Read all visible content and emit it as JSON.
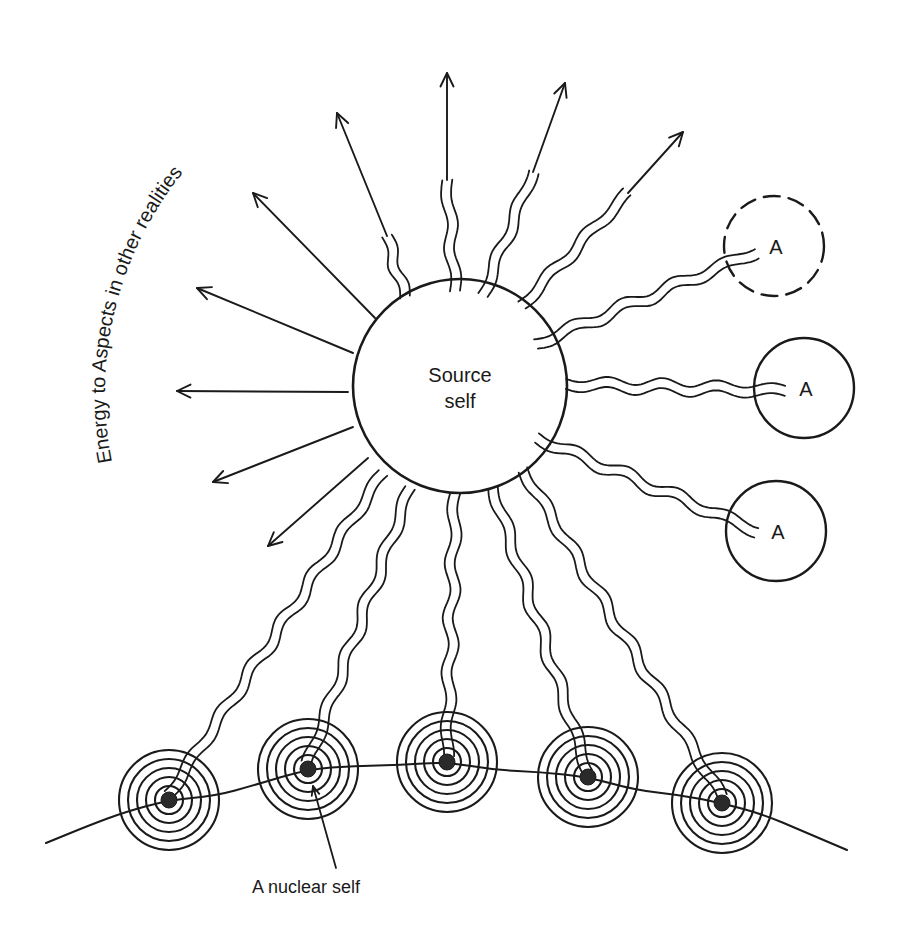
{
  "diagram": {
    "ink_color": "#1a1a1a",
    "background": "#ffffff",
    "source_self": {
      "label_line1": "Source",
      "label_line2": "self",
      "cx": 460,
      "cy": 386,
      "r": 107
    },
    "arc_caption": {
      "text": "Energy to Aspects in other realities",
      "arc": {
        "cx": 460,
        "cy": 386,
        "r": 350,
        "start_deg": 197,
        "end_deg": 262
      }
    },
    "energy_arrows_left": [
      {
        "from": [
          375,
          318
        ],
        "to": [
          253,
          193
        ]
      },
      {
        "from": [
          353,
          353
        ],
        "to": [
          197,
          288
        ]
      },
      {
        "from": [
          348,
          392
        ],
        "to": [
          177,
          391
        ]
      },
      {
        "from": [
          353,
          427
        ],
        "to": [
          213,
          482
        ]
      },
      {
        "from": [
          368,
          458
        ],
        "to": [
          268,
          546
        ]
      }
    ],
    "energy_arrows_top": [
      {
        "wave_from": [
          405,
          297
        ],
        "wave_to": [
          387,
          236
        ],
        "tip": [
          337,
          113
        ]
      },
      {
        "wave_from": [
          455,
          291
        ],
        "wave_to": [
          447,
          180
        ],
        "tip": [
          447,
          73
        ]
      },
      {
        "wave_from": [
          483,
          295
        ],
        "wave_to": [
          533,
          172
        ],
        "tip": [
          565,
          83
        ]
      },
      {
        "wave_from": [
          522,
          305
        ],
        "wave_to": [
          628,
          193
        ],
        "tip": [
          683,
          132
        ]
      }
    ],
    "aspects": [
      {
        "label": "A",
        "cx": 774,
        "cy": 246,
        "r": 50,
        "dashed": true,
        "link_from": [
          536,
          344
        ],
        "link_to": [
          756,
          252
        ]
      },
      {
        "label": "A",
        "cx": 804,
        "cy": 388,
        "r": 50,
        "dashed": false,
        "link_from": [
          566,
          384
        ],
        "link_to": [
          785,
          391
        ]
      },
      {
        "label": "A",
        "cx": 776,
        "cy": 531,
        "r": 50,
        "dashed": false,
        "link_from": [
          537,
          438
        ],
        "link_to": [
          757,
          531
        ]
      }
    ],
    "nuclear_selves": [
      {
        "cx": 169,
        "cy": 800,
        "link_from": [
          383,
          473
        ]
      },
      {
        "cx": 308,
        "cy": 769,
        "link_from": [
          410,
          488
        ]
      },
      {
        "cx": 447,
        "cy": 762,
        "link_from": [
          455,
          494
        ]
      },
      {
        "cx": 588,
        "cy": 777,
        "link_from": [
          493,
          488
        ]
      },
      {
        "cx": 722,
        "cy": 803,
        "link_from": [
          523,
          470
        ]
      }
    ],
    "nuclear_ring_radii": [
      50,
      41,
      32,
      23,
      14
    ],
    "nucleus_radius": 8,
    "baseline_wave": {
      "points": [
        [
          46,
          843
        ],
        [
          90,
          825
        ],
        [
          125,
          812
        ],
        [
          169,
          800
        ],
        [
          215,
          796
        ],
        [
          255,
          785
        ],
        [
          308,
          769
        ],
        [
          355,
          766
        ],
        [
          400,
          765
        ],
        [
          447,
          762
        ],
        [
          495,
          770
        ],
        [
          540,
          772
        ],
        [
          588,
          777
        ],
        [
          635,
          790
        ],
        [
          680,
          795
        ],
        [
          722,
          803
        ],
        [
          765,
          815
        ],
        [
          800,
          830
        ],
        [
          847,
          850
        ]
      ]
    },
    "callout": {
      "label": "A nuclear self",
      "label_x": 306,
      "label_y": 893,
      "pointer_from": [
        336,
        868
      ],
      "pointer_to": [
        313,
        786
      ]
    }
  }
}
